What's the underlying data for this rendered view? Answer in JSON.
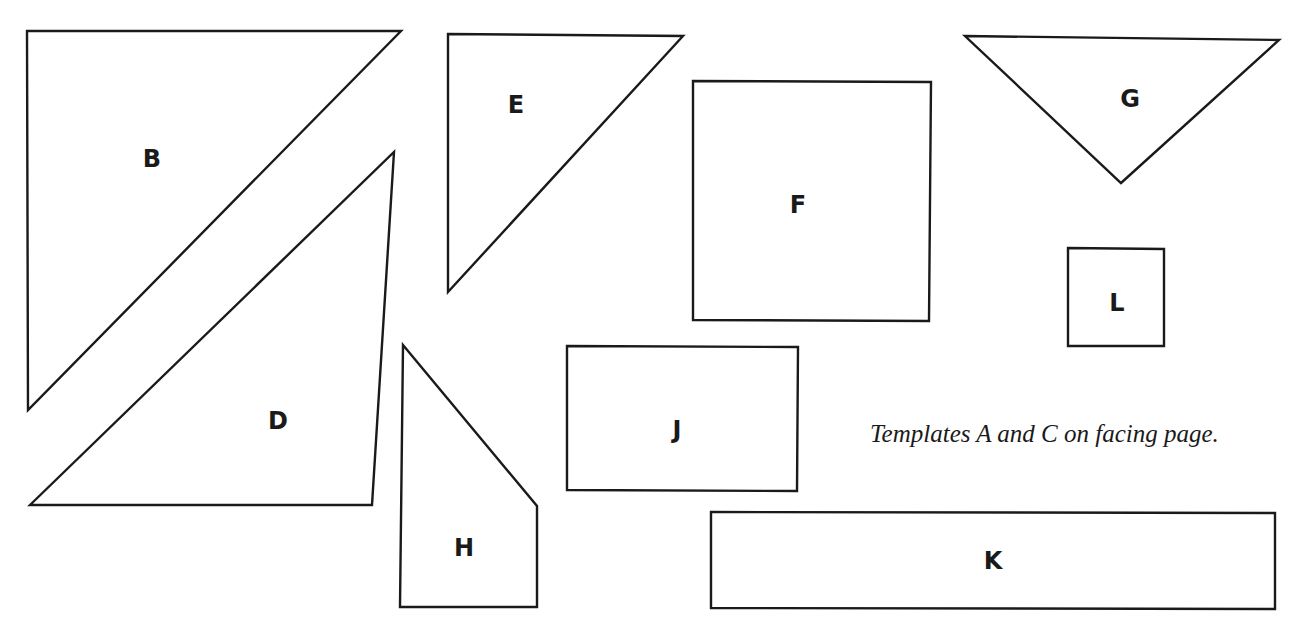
{
  "page": {
    "background": "#ffffff",
    "stroke_color": "#1a1a1a"
  },
  "templates": [
    {
      "id": "B",
      "label": "B",
      "shape": "right-triangle",
      "points": "27,31 401,31 28,410",
      "label_pos": [
        152,
        160
      ]
    },
    {
      "id": "D",
      "label": "D",
      "shape": "triangle",
      "points": "30,505 394,152 372,505",
      "label_pos": [
        278,
        422
      ]
    },
    {
      "id": "E",
      "label": "E",
      "shape": "right-triangle",
      "points": "448,34 683,36 448,292",
      "label_pos": [
        516,
        106
      ]
    },
    {
      "id": "F",
      "label": "F",
      "shape": "square",
      "points": "693,81 931,82 929,321 693,320",
      "label_pos": [
        798,
        206
      ]
    },
    {
      "id": "G",
      "label": "G",
      "shape": "inverted-triangle",
      "points": "965,36 1279,40 1121,183",
      "label_pos": [
        1130,
        100
      ]
    },
    {
      "id": "L",
      "label": "L",
      "shape": "square",
      "points": "1068,248 1164,249 1164,346 1068,346",
      "label_pos": [
        1117,
        304
      ]
    },
    {
      "id": "H",
      "label": "H",
      "shape": "quadrilateral",
      "points": "403,345 537,506 537,607 400,607",
      "label_pos": [
        464,
        549
      ]
    },
    {
      "id": "J",
      "label": "J",
      "shape": "rectangle",
      "points": "567,346 798,347 797,491 567,490",
      "label_pos": [
        677,
        431
      ]
    },
    {
      "id": "K",
      "label": "K",
      "shape": "rectangle",
      "points": "711,512 1275,513 1275,609 711,608",
      "label_pos": [
        993,
        562
      ]
    }
  ],
  "caption": "Templates A and C on facing page."
}
